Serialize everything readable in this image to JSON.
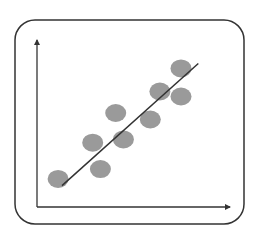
{
  "chart_data": {
    "type": "scatter",
    "title": "",
    "xlabel": "",
    "ylabel": "",
    "grid": false,
    "legend": null,
    "x_range": [
      0,
      10
    ],
    "y_range": [
      0,
      10
    ],
    "points": [
      {
        "x": 1.1,
        "y": 1.7
      },
      {
        "x": 3.3,
        "y": 2.3
      },
      {
        "x": 2.9,
        "y": 3.9
      },
      {
        "x": 4.5,
        "y": 4.1
      },
      {
        "x": 4.1,
        "y": 5.7
      },
      {
        "x": 5.9,
        "y": 5.3
      },
      {
        "x": 6.4,
        "y": 7.0
      },
      {
        "x": 7.5,
        "y": 6.7
      },
      {
        "x": 7.5,
        "y": 8.4
      }
    ],
    "trendline": {
      "x0": 1.3,
      "y0": 1.3,
      "x1": 8.4,
      "y1": 8.7
    },
    "colors": {
      "points": "#9a9a9a",
      "trendline": "#333333",
      "axes": "#333333",
      "frame": "#333333"
    }
  },
  "plot": {
    "px_origin": [
      37,
      207
    ],
    "px_per_unit_x": 19.2,
    "px_per_unit_y": 16.5,
    "point_radius": 10
  }
}
